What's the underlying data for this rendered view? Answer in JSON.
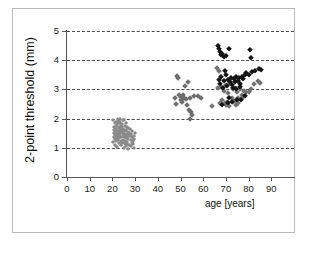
{
  "chart_data": {
    "type": "scatter",
    "title": "",
    "xlabel": "age [years]",
    "ylabel": "2-point threshold (mm)",
    "xlim": [
      0,
      100
    ],
    "ylim": [
      0,
      5
    ],
    "xticks": [
      0,
      10,
      20,
      30,
      40,
      50,
      60,
      70,
      80,
      90
    ],
    "yticks": [
      0,
      1,
      2,
      3,
      4,
      5
    ],
    "grid": "horizontal-dashed",
    "legend": "none",
    "marker": "diamond",
    "colors": {
      "young_group": "#8a8a8a",
      "middle_group": "#6e6e6e",
      "older_gray": "#737373",
      "older_black": "#151515",
      "axis": "#555555",
      "gridline": "#4a4a4a",
      "frame": "#b9b9b9"
    },
    "series": [
      {
        "name": "young adults",
        "color": "#8a8a8a",
        "marker_size": "small",
        "points": [
          [
            20.2,
            1.95
          ],
          [
            20.5,
            1.72
          ],
          [
            20.6,
            1.5
          ],
          [
            20.8,
            1.38
          ],
          [
            20.9,
            1.62
          ],
          [
            21.0,
            1.85
          ],
          [
            21.1,
            1.45
          ],
          [
            21.2,
            1.3
          ],
          [
            21.3,
            1.7
          ],
          [
            21.4,
            1.55
          ],
          [
            21.5,
            1.9
          ],
          [
            21.6,
            1.42
          ],
          [
            21.7,
            1.25
          ],
          [
            21.8,
            1.65
          ],
          [
            21.9,
            1.8
          ],
          [
            22.0,
            1.48
          ],
          [
            22.1,
            1.35
          ],
          [
            22.2,
            1.75
          ],
          [
            22.3,
            1.58
          ],
          [
            22.4,
            1.92
          ],
          [
            22.5,
            1.4
          ],
          [
            22.6,
            1.28
          ],
          [
            22.7,
            1.68
          ],
          [
            22.8,
            1.52
          ],
          [
            22.9,
            1.86
          ],
          [
            23.0,
            1.44
          ],
          [
            23.1,
            1.32
          ],
          [
            23.2,
            1.72
          ],
          [
            23.3,
            1.6
          ],
          [
            23.4,
            1.88
          ],
          [
            23.5,
            1.46
          ],
          [
            23.6,
            1.22
          ],
          [
            23.7,
            1.64
          ],
          [
            23.8,
            1.54
          ],
          [
            23.9,
            1.78
          ],
          [
            24.0,
            1.38
          ],
          [
            24.1,
            1.18
          ],
          [
            24.2,
            1.7
          ],
          [
            24.3,
            1.56
          ],
          [
            24.4,
            1.82
          ],
          [
            24.5,
            1.42
          ],
          [
            24.6,
            1.26
          ],
          [
            24.7,
            1.66
          ],
          [
            24.8,
            1.5
          ],
          [
            24.9,
            1.94
          ],
          [
            25.0,
            1.36
          ],
          [
            25.1,
            1.15
          ],
          [
            25.2,
            1.62
          ],
          [
            25.3,
            1.48
          ],
          [
            25.4,
            1.76
          ],
          [
            25.5,
            1.4
          ],
          [
            25.6,
            1.24
          ],
          [
            25.7,
            1.58
          ],
          [
            25.8,
            1.44
          ],
          [
            25.9,
            1.84
          ],
          [
            26.0,
            1.34
          ],
          [
            26.1,
            1.12
          ],
          [
            26.2,
            1.6
          ],
          [
            26.3,
            1.46
          ],
          [
            26.4,
            1.72
          ],
          [
            26.5,
            1.38
          ],
          [
            26.6,
            1.2
          ],
          [
            26.7,
            1.54
          ],
          [
            26.8,
            1.42
          ],
          [
            26.9,
            1.68
          ],
          [
            27.0,
            1.3
          ],
          [
            27.2,
            1.08
          ],
          [
            27.4,
            1.52
          ],
          [
            27.6,
            1.4
          ],
          [
            27.8,
            1.64
          ],
          [
            28.0,
            1.26
          ],
          [
            28.2,
            1.05
          ],
          [
            28.4,
            1.48
          ],
          [
            28.6,
            1.36
          ],
          [
            28.8,
            1.58
          ],
          [
            29.0,
            1.22
          ],
          [
            29.3,
            0.98
          ],
          [
            29.5,
            1.42
          ],
          [
            29.7,
            1.3
          ],
          [
            29.9,
            1.5
          ],
          [
            21.0,
            1.1
          ],
          [
            22.0,
            1.02
          ],
          [
            23.0,
            1.15
          ],
          [
            24.0,
            1.08
          ],
          [
            25.0,
            1.0
          ],
          [
            26.0,
            1.05
          ],
          [
            27.0,
            0.95
          ],
          [
            23.5,
            2.0
          ],
          [
            22.5,
            1.98
          ],
          [
            24.5,
            1.96
          ],
          [
            25.5,
            1.18
          ],
          [
            26.5,
            1.14
          ],
          [
            20.4,
            1.2
          ],
          [
            28.5,
            1.16
          ],
          [
            29.2,
            1.12
          ]
        ]
      },
      {
        "name": "middle-aged adults",
        "color": "#6e6e6e",
        "marker_size": "medium",
        "points": [
          [
            47.5,
            2.7
          ],
          [
            48.0,
            2.5
          ],
          [
            48.6,
            3.45
          ],
          [
            49.0,
            3.38
          ],
          [
            49.5,
            2.82
          ],
          [
            50.0,
            2.62
          ],
          [
            50.4,
            2.74
          ],
          [
            50.8,
            2.58
          ],
          [
            51.2,
            2.8
          ],
          [
            51.6,
            2.7
          ],
          [
            52.0,
            3.1
          ],
          [
            52.4,
            2.66
          ],
          [
            52.8,
            2.46
          ],
          [
            53.2,
            3.25
          ],
          [
            53.6,
            2.3
          ],
          [
            54.0,
            2.72
          ],
          [
            54.4,
            1.98
          ],
          [
            54.8,
            2.22
          ],
          [
            55.2,
            2.12
          ],
          [
            56.0,
            2.76
          ],
          [
            57.5,
            2.78
          ],
          [
            59.0,
            2.72
          ]
        ]
      },
      {
        "name": "older adults (gray)",
        "color": "#737373",
        "marker_size": "medium",
        "points": [
          [
            64.0,
            2.42
          ],
          [
            66.0,
            3.72
          ],
          [
            66.5,
            3.05
          ],
          [
            67.0,
            3.62
          ],
          [
            67.5,
            2.55
          ],
          [
            68.0,
            3.08
          ],
          [
            68.5,
            2.62
          ],
          [
            69.0,
            2.96
          ],
          [
            69.5,
            2.52
          ],
          [
            70.0,
            3.15
          ],
          [
            70.5,
            2.58
          ],
          [
            71.0,
            2.88
          ],
          [
            71.5,
            2.44
          ],
          [
            72.0,
            3.22
          ],
          [
            72.5,
            2.7
          ],
          [
            73.0,
            3.0
          ],
          [
            73.5,
            2.6
          ],
          [
            74.0,
            3.05
          ],
          [
            74.5,
            2.48
          ],
          [
            75.0,
            2.92
          ],
          [
            75.5,
            2.72
          ],
          [
            76.0,
            3.02
          ],
          [
            76.5,
            2.66
          ],
          [
            77.0,
            2.8
          ],
          [
            77.5,
            2.74
          ],
          [
            78.0,
            2.96
          ],
          [
            79.0,
            2.9
          ],
          [
            80.0,
            2.92
          ],
          [
            81.0,
            3.0
          ],
          [
            82.5,
            3.18
          ],
          [
            84.0,
            3.28
          ],
          [
            85.0,
            3.22
          ],
          [
            73.2,
            2.56
          ],
          [
            75.2,
            2.52
          ],
          [
            70.2,
            2.46
          ]
        ]
      },
      {
        "name": "older adults (black)",
        "color": "#151515",
        "marker_size": "large",
        "points": [
          [
            66.5,
            4.48
          ],
          [
            67.0,
            4.4
          ],
          [
            67.2,
            4.28
          ],
          [
            67.8,
            4.18
          ],
          [
            68.4,
            4.22
          ],
          [
            69.0,
            4.12
          ],
          [
            70.0,
            4.15
          ],
          [
            71.5,
            4.4
          ],
          [
            80.8,
            4.34
          ],
          [
            81.0,
            4.08
          ],
          [
            66.8,
            3.32
          ],
          [
            67.4,
            3.18
          ],
          [
            68.0,
            3.42
          ],
          [
            68.6,
            3.05
          ],
          [
            69.2,
            3.28
          ],
          [
            70.0,
            3.48
          ],
          [
            70.5,
            3.12
          ],
          [
            71.0,
            3.32
          ],
          [
            71.6,
            3.24
          ],
          [
            72.2,
            3.4
          ],
          [
            72.8,
            3.16
          ],
          [
            73.4,
            3.34
          ],
          [
            74.0,
            3.26
          ],
          [
            74.6,
            3.44
          ],
          [
            75.2,
            3.3
          ],
          [
            75.8,
            3.38
          ],
          [
            76.4,
            3.2
          ],
          [
            77.0,
            3.42
          ],
          [
            77.6,
            3.35
          ],
          [
            78.2,
            3.5
          ],
          [
            79.0,
            3.55
          ],
          [
            80.0,
            3.48
          ],
          [
            81.5,
            3.58
          ],
          [
            83.0,
            3.62
          ],
          [
            84.5,
            3.7
          ],
          [
            85.5,
            3.66
          ],
          [
            73.0,
            3.05
          ],
          [
            74.4,
            3.02
          ],
          [
            76.0,
            3.08
          ],
          [
            69.6,
            3.62
          ],
          [
            71.2,
            2.72
          ],
          [
            72.5,
            2.58
          ],
          [
            74.8,
            2.64
          ],
          [
            76.8,
            2.62
          ],
          [
            78.5,
            2.76
          ],
          [
            68.2,
            2.48
          ],
          [
            70.8,
            2.52
          ]
        ]
      }
    ]
  },
  "axes": {
    "x": {
      "label": "age [years]",
      "tick_labels": [
        "0",
        "10",
        "20",
        "30",
        "40",
        "50",
        "60",
        "70",
        "80",
        "90"
      ]
    },
    "y": {
      "label": "2-point threshold (mm)",
      "tick_labels": [
        "0",
        "1",
        "2",
        "3",
        "4",
        "5"
      ]
    }
  }
}
